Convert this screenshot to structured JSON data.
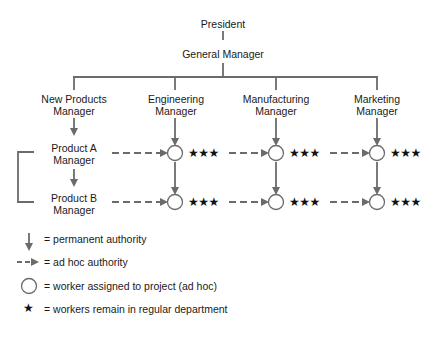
{
  "colors": {
    "line": "#6b6b6b",
    "text": "#1a1a1a",
    "star": "#111111",
    "background": "#ffffff"
  },
  "top": {
    "president": "President",
    "general_manager": "General Manager"
  },
  "departments": [
    {
      "line1": "New Products",
      "line2": "Manager"
    },
    {
      "line1": "Engineering",
      "line2": "Manager"
    },
    {
      "line1": "Manufacturing",
      "line2": "Manager"
    },
    {
      "line1": "Marketing",
      "line2": "Manager"
    }
  ],
  "product_managers": [
    {
      "line1": "Product A",
      "line2": "Manager"
    },
    {
      "line1": "Product B",
      "line2": "Manager"
    }
  ],
  "matrix": {
    "stars": "★★★",
    "rows": 2,
    "columns": [
      "Engineering",
      "Manufacturing",
      "Marketing"
    ]
  },
  "legend": [
    {
      "symbol": "solid-arrow-down",
      "text": "= permanent authority"
    },
    {
      "symbol": "dashed-arrow-right",
      "text": "= ad hoc authority"
    },
    {
      "symbol": "circle",
      "text": "= worker assigned to project (ad hoc)"
    },
    {
      "symbol": "star",
      "text": "= workers remain in regular department"
    }
  ]
}
